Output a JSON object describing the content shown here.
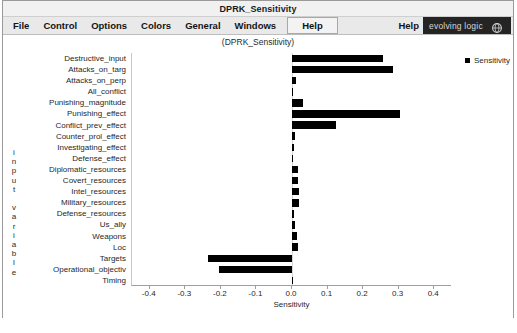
{
  "window": {
    "title": "DPRK_Sensitivity",
    "subtitle": "(DPRK_Sensitivity)"
  },
  "menubar": {
    "items": [
      {
        "label": "File",
        "name": "menu-file"
      },
      {
        "label": "Control",
        "name": "menu-control"
      },
      {
        "label": "Options",
        "name": "menu-options"
      },
      {
        "label": "Colors",
        "name": "menu-colors"
      },
      {
        "label": "General",
        "name": "menu-general"
      },
      {
        "label": "Windows",
        "name": "menu-windows"
      }
    ],
    "help_boxed_label": "Help",
    "help_right_label": "Help",
    "brand_label": "evolving logic",
    "brand_icon": "globe-icon",
    "brand_bg": "#242424",
    "brand_fg": "#d8d8d8"
  },
  "chart_data": {
    "type": "bar",
    "orientation": "horizontal",
    "title": "DPRK_Sensitivity",
    "xlabel": "Sensitivity",
    "ylabel": "input variable",
    "xlim": [
      -0.45,
      0.45
    ],
    "xticks": [
      -0.4,
      -0.3,
      -0.2,
      -0.1,
      0.0,
      0.1,
      0.2,
      0.3,
      0.4
    ],
    "xtick_labels": [
      "-0.4",
      "-0.3",
      "-0.2",
      "-0.1",
      "0.0",
      "0.1",
      "0.2",
      "0.3",
      "0.4"
    ],
    "grid": false,
    "legend": {
      "position": "top-right",
      "entries": [
        "Sensitivity"
      ]
    },
    "series_name": "Sensitivity",
    "bar_color": "#000000",
    "categories": [
      "Destructive_input",
      "Attacks_on_targ",
      "Attacks_on_perp",
      "All_conflict",
      "Punishing_magnitude",
      "Punishing_effect",
      "Conflict_prev_effect",
      "Counter_prol_effect",
      "Investigating_effect",
      "Defense_effect",
      "Diplomatic_resources",
      "Covert_resources",
      "Intel_resources",
      "Military_resources",
      "Defense_resources",
      "Us_ally",
      "Weapons",
      "Loc",
      "Targets",
      "Operational_objectiv",
      "Timing"
    ],
    "values": [
      0.255,
      0.285,
      0.012,
      0.004,
      0.032,
      0.305,
      0.125,
      0.008,
      0.005,
      0.003,
      0.016,
      0.018,
      0.019,
      0.021,
      0.006,
      0.008,
      0.014,
      0.018,
      -0.235,
      -0.205,
      0.003
    ]
  }
}
